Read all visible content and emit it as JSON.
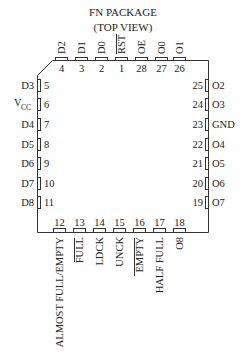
{
  "title": {
    "line1": "FN PACKAGE",
    "line2": "(TOP VIEW)"
  },
  "colors": {
    "ink": "#222222",
    "background": "#ffffff"
  },
  "pins": {
    "top": [
      {
        "num": "4",
        "name": "D2",
        "overbar": false
      },
      {
        "num": "3",
        "name": "D1",
        "overbar": false
      },
      {
        "num": "2",
        "name": "D0",
        "overbar": false
      },
      {
        "num": "1",
        "name": "RST",
        "overbar": true
      },
      {
        "num": "28",
        "name": "OE",
        "overbar": false
      },
      {
        "num": "27",
        "name": "O0",
        "overbar": false
      },
      {
        "num": "26",
        "name": "O1",
        "overbar": false
      }
    ],
    "left": [
      {
        "num": "5",
        "name": "D3"
      },
      {
        "num": "6",
        "name": "V",
        "sub": "CC"
      },
      {
        "num": "7",
        "name": "D4"
      },
      {
        "num": "8",
        "name": "D5"
      },
      {
        "num": "9",
        "name": "D6"
      },
      {
        "num": "10",
        "name": "D7"
      },
      {
        "num": "11",
        "name": "D8"
      }
    ],
    "right": [
      {
        "num": "25",
        "name": "O2"
      },
      {
        "num": "24",
        "name": "O3"
      },
      {
        "num": "23",
        "name": "GND"
      },
      {
        "num": "22",
        "name": "O4"
      },
      {
        "num": "21",
        "name": "O5"
      },
      {
        "num": "20",
        "name": "O6"
      },
      {
        "num": "19",
        "name": "O7"
      }
    ],
    "bottom": [
      {
        "num": "12",
        "name": "ALMOST FULL/EMPTY",
        "overbar": false
      },
      {
        "num": "13",
        "name": "FULL",
        "overbar": true
      },
      {
        "num": "14",
        "name": "LDCK",
        "overbar": false
      },
      {
        "num": "15",
        "name": "UNCK",
        "overbar": false
      },
      {
        "num": "16",
        "name": "EMPTY",
        "overbar": true
      },
      {
        "num": "17",
        "name": "HALF FULL",
        "overbar": false
      },
      {
        "num": "18",
        "name": "O8",
        "overbar": false
      }
    ]
  }
}
